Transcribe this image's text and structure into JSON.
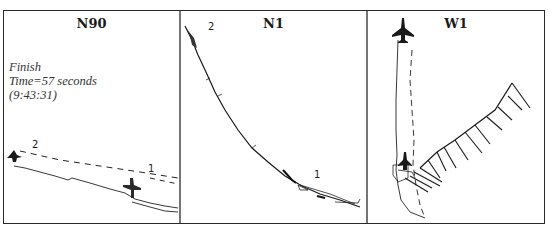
{
  "figure": {
    "panels": [
      {
        "title": "N90",
        "caption": {
          "line1": "Finish",
          "line2": "Time=57 seconds",
          "line3": "(9:43:31)"
        },
        "markers": [
          {
            "label": "2"
          },
          {
            "label": "1"
          }
        ]
      },
      {
        "title": "N1",
        "markers": [
          {
            "label": "2"
          },
          {
            "label": "1"
          }
        ]
      },
      {
        "title": "W1"
      }
    ],
    "colors": {
      "ink": "#1a1a1a",
      "background": "#ffffff"
    }
  }
}
